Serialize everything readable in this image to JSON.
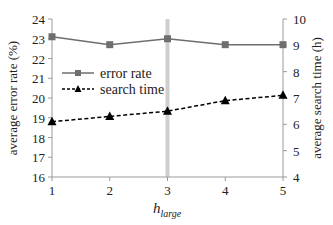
{
  "chart_data": {
    "type": "line",
    "title": "",
    "xlabel": "h",
    "xlabel_subscript": "large",
    "ylabel": "average error rate (%)",
    "y2label": "average search time (h)",
    "categories": [
      1,
      2,
      3,
      4,
      5
    ],
    "x_ticks": [
      "1",
      "2",
      "3",
      "4",
      "5"
    ],
    "ylim": [
      16,
      24
    ],
    "y_ticks": [
      "16",
      "17",
      "18",
      "19",
      "20",
      "21",
      "22",
      "23",
      "24"
    ],
    "y2lim": [
      4,
      10
    ],
    "y2_ticks": [
      "4",
      "5",
      "6",
      "7",
      "8",
      "9",
      "10"
    ],
    "grid": false,
    "highlight_x": 3,
    "legend_position": "upper-left-inside",
    "series": [
      {
        "name": "error rate",
        "axis": "left",
        "values": [
          23.1,
          22.7,
          23.0,
          22.7,
          22.7
        ],
        "marker": "square",
        "line": "solid",
        "color": "#6e6e6e"
      },
      {
        "name": "search time",
        "axis": "right",
        "values": [
          6.1,
          6.3,
          6.5,
          6.9,
          7.1
        ],
        "marker": "triangle",
        "line": "dashed",
        "color": "#000000"
      }
    ]
  },
  "legend": {
    "items": [
      "error rate",
      "search time"
    ]
  },
  "colors": {
    "axis": "#9a9a9a",
    "highlight": "#cfcfcf",
    "error_rate": "#6e6e6e",
    "search_time": "#000000"
  }
}
